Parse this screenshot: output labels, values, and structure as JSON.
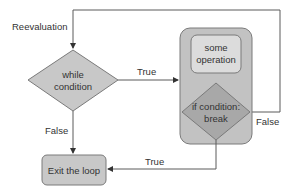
{
  "diagram": {
    "type": "flowchart",
    "colors": {
      "background": "#ffffff",
      "shape_fill": "#c8c8c8",
      "container_fill": "#c2c2c2",
      "inner_box_fill": "#dcdcdc",
      "break_diamond_fill": "#a8a8a8",
      "stroke": "#5a5a5a",
      "text": "#333333"
    },
    "nodes": {
      "while_condition": {
        "line1": "while",
        "line2": "condition"
      },
      "some_operation": {
        "line1": "some",
        "line2": "operation"
      },
      "if_break": {
        "line1": "if condition:",
        "line2": "break"
      },
      "exit": {
        "label": "Exit the loop"
      }
    },
    "edges": {
      "reevaluation": "Reevaluation",
      "while_true": "True",
      "while_false": "False",
      "break_true": "True",
      "break_false": "False"
    }
  }
}
